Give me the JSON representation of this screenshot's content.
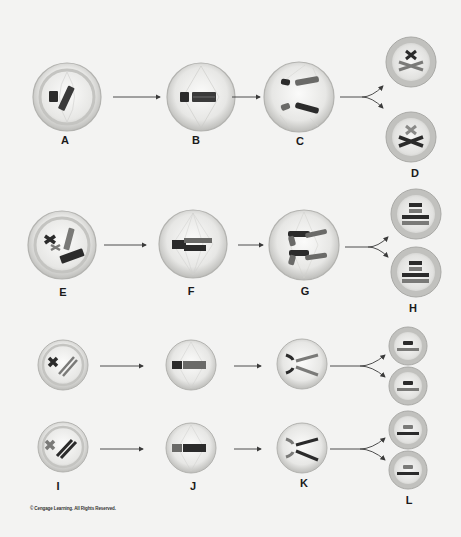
{
  "diagram": {
    "rows": [
      {
        "name": "row-1",
        "stages": [
          {
            "label": "A",
            "description": "cell with one short dark chromosome and one long grey chromosome, spindle forming"
          },
          {
            "label": "B",
            "description": "chromosomes aligned at metaphase plate with spindle"
          },
          {
            "label": "C",
            "description": "sister chromatids separating toward poles"
          },
          {
            "label": "D",
            "description": "two daughter cells each with X-shaped chromosomes"
          }
        ]
      },
      {
        "name": "row-2",
        "stages": [
          {
            "label": "E",
            "description": "cell with four chromosomes (two dark, two grey)"
          },
          {
            "label": "F",
            "description": "chromosomes aligned at metaphase plate"
          },
          {
            "label": "G",
            "description": "chromatids separating toward poles"
          },
          {
            "label": "H",
            "description": "two daughter cells each with four bar chromosomes"
          }
        ]
      },
      {
        "name": "row-3",
        "stages": [
          {
            "label": "I",
            "description": "two cells with one short and one long chromosome"
          },
          {
            "label": "J",
            "description": "chromosomes aligned at metaphase plate"
          },
          {
            "label": "K",
            "description": "chromatids separating"
          },
          {
            "label": "L",
            "description": "four daughter cells each with two bar chromosomes"
          }
        ]
      }
    ],
    "copyright": "© Cengage Learning. All Rights Reserved.",
    "colors": {
      "background": "#f3f3f2",
      "cell_fill": "#e6e6e4",
      "cell_rim": "#b9b9b6",
      "dark_chromosome": "#2b2b2b",
      "grey_chromosome": "#7a7a78",
      "arrow": "#3a3a3a",
      "spindle": "#c9c9c6"
    }
  }
}
